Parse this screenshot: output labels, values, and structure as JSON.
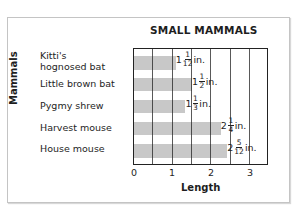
{
  "chart_data": {
    "type": "bar",
    "orientation": "horizontal",
    "title": "SMALL MAMMALS",
    "xlabel": "Length",
    "ylabel": "Mammals",
    "xlim": [
      0,
      3.5
    ],
    "x_ticks": [
      "0",
      "1",
      "2",
      "3"
    ],
    "grid": "vertical lines every 0.5",
    "categories": [
      "Kitti's hognosed bat",
      "Little brown bat",
      "Pygmy shrew",
      "Harvest mouse",
      "House mouse"
    ],
    "values": [
      1.0833,
      1.5,
      1.3333,
      2.25,
      2.4167
    ],
    "value_labels": [
      {
        "whole": "1",
        "num": "1",
        "den": "12",
        "unit": "in."
      },
      {
        "whole": "1",
        "num": "1",
        "den": "2",
        "unit": "in."
      },
      {
        "whole": "1",
        "num": "1",
        "den": "3",
        "unit": "in."
      },
      {
        "whole": "2",
        "num": "1",
        "den": "4",
        "unit": "in."
      },
      {
        "whole": "2",
        "num": "5",
        "den": "12",
        "unit": "in."
      }
    ],
    "bar_color": "#c8c8c8",
    "grid_color": "#222222"
  },
  "labels": {
    "title": "SMALL MAMMALS",
    "ylabel": "Mammals",
    "xlabel": "Length",
    "cat0_line1": "Kitti's",
    "cat0_line2": "hognosed bat",
    "cat1": "Little brown bat",
    "cat2": "Pygmy shrew",
    "cat3": "Harvest mouse",
    "cat4": "House mouse",
    "tick0": "0",
    "tick1": "1",
    "tick2": "2",
    "tick3": "3"
  }
}
